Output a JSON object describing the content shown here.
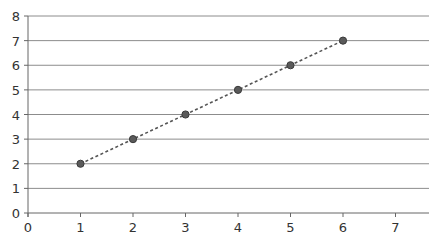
{
  "chart_data": {
    "type": "line",
    "title": "",
    "xlabel": "",
    "ylabel": "",
    "xlim": [
      0,
      7.7
    ],
    "ylim": [
      0,
      8
    ],
    "x_ticks": [
      0,
      1,
      2,
      3,
      4,
      5,
      6,
      7
    ],
    "y_ticks": [
      0,
      1,
      2,
      3,
      4,
      5,
      6,
      7,
      8
    ],
    "grid": {
      "horizontal": true,
      "vertical": false
    },
    "legend": null,
    "series": [
      {
        "name": "Series 1",
        "x": [
          1,
          2,
          3,
          4,
          5,
          6
        ],
        "values": [
          2,
          3,
          4,
          5,
          6,
          7
        ],
        "line_style": "dotted",
        "marker": "circle",
        "color": "#555555"
      }
    ]
  },
  "style": {
    "gridline_color": "#8c8c8c",
    "axis_color": "#666666",
    "marker_fill": "#5a5a5a",
    "marker_stroke": "#3a3a3a"
  }
}
